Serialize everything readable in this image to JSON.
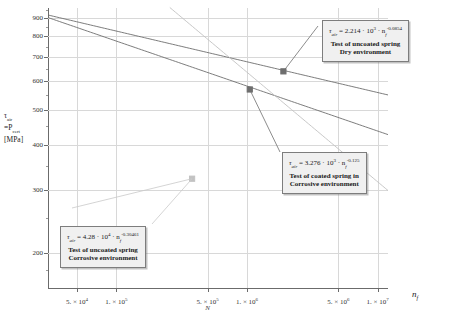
{
  "chart_data": {
    "type": "line",
    "title": "",
    "xlabel": "n_f",
    "ylabel": "tau_air = P_cert [MPa]",
    "scale": {
      "x": "log",
      "y": "log"
    },
    "xlim": [
      30000,
      12000000
    ],
    "ylim": [
      160,
      960
    ],
    "grid": true,
    "legend_position": "annotation-callouts",
    "x_ticks": [
      {
        "value": 50000,
        "label": "5. × 10",
        "exp": "4"
      },
      {
        "value": 100000,
        "label": "1. × 10",
        "exp": "5"
      },
      {
        "value": 500000,
        "label": "5. × 10",
        "exp": "5"
      },
      {
        "value": 1000000,
        "label": "1. × 10",
        "exp": "6"
      },
      {
        "value": 5000000,
        "label": "5. × 10",
        "exp": "6"
      },
      {
        "value": 10000000,
        "label": "1. × 10",
        "exp": "7"
      }
    ],
    "y_ticks": [
      900,
      800,
      700,
      600,
      500,
      400,
      300,
      200
    ],
    "series": [
      {
        "name": "Test of uncoated spring - Dry environment",
        "equation": "tau_air = 2.214e3 * n_f^-0.0854",
        "coefficient": 2214,
        "exponent": -0.0854,
        "color": "#6e6e6e",
        "marker_point": {
          "x": 1900000,
          "y": 640
        }
      },
      {
        "name": "Test of coated spring in Corrosive environment",
        "equation": "tau_air = 3.276e3 * n_f^-0.125",
        "coefficient": 3276,
        "exponent": -0.125,
        "color": "#6e6e6e",
        "marker_point": {
          "x": 1050000,
          "y": 570
        }
      },
      {
        "name": "Test of uncoated spring - Corrosive environment",
        "equation": "tau_air = 4.28e4 * n_f^-0.30461",
        "coefficient": 42800,
        "exponent": -0.30461,
        "color": "#c2c2c2",
        "marker_point": {
          "x": 380000,
          "y": 322
        }
      }
    ]
  },
  "axes": {
    "y_title_line1": "τ",
    "y_title_sub1": "air",
    "y_title_line2": "=P",
    "y_title_sub2": "cert",
    "y_title_line3": "[MPa]",
    "x_title": "n",
    "x_title_sub": "f",
    "n_marker": "N"
  },
  "annotations": [
    {
      "id": "dry",
      "eq_tau": "τ",
      "eq_tau_sub": "air",
      "eq_equals": " = 2.214 · 10",
      "eq_exp1": "3",
      "eq_dot": " · n",
      "eq_nsub": "f",
      "eq_exp2": "-0.0854",
      "line1": "Test of uncoated spring",
      "line2": "Dry environment"
    },
    {
      "id": "coated",
      "eq_tau": "τ",
      "eq_tau_sub": "air",
      "eq_equals": " = 3.276 · 10",
      "eq_exp1": "3",
      "eq_dot": " · n",
      "eq_nsub": "f",
      "eq_exp2": "-0.125",
      "line1": "Test of coated spring in",
      "line2": "Corrosive environment"
    },
    {
      "id": "uncoated-corrosive",
      "eq_tau": "τ",
      "eq_tau_sub": "air",
      "eq_equals": " = 4.28 · 10",
      "eq_exp1": "4",
      "eq_dot": " · n",
      "eq_nsub": "f",
      "eq_exp2": "-0.30461",
      "line1": "Test of uncoated spring",
      "line2": "Corrosive environment"
    }
  ]
}
